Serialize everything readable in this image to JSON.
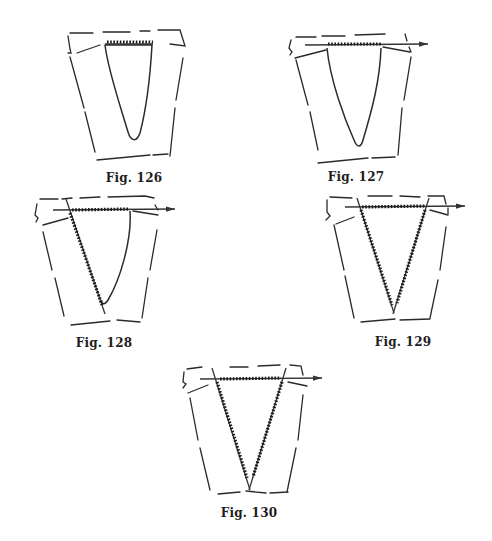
{
  "page": {
    "background": "#ffffff",
    "ink_color": "#2a2a2a"
  },
  "figures": [
    {
      "id": "fig126",
      "caption": "Fig. 126",
      "needles": 0,
      "description": "V-neck opening, stitches bound at top edge"
    },
    {
      "id": "fig127",
      "caption": "Fig. 127",
      "needles": 1,
      "description": "Stitches across top of V on horizontal needle"
    },
    {
      "id": "fig128",
      "caption": "Fig. 128",
      "needles": 2,
      "description": "Horizontal needle plus needle picking up left side of V"
    },
    {
      "id": "fig129",
      "caption": "Fig. 129",
      "needles": 3,
      "description": "Three needles: top and both sides of V"
    },
    {
      "id": "fig130",
      "caption": "Fig. 130",
      "needles": 3,
      "description": "Three needles meeting at point of V"
    }
  ]
}
